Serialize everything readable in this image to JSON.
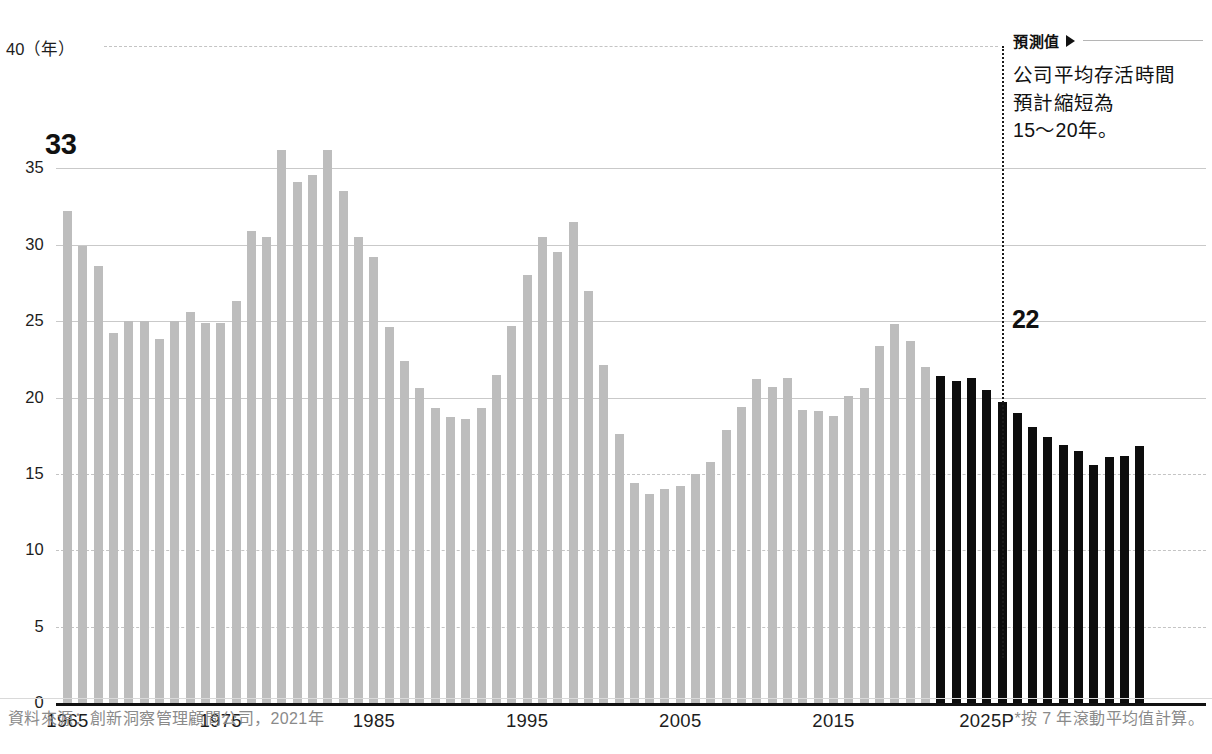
{
  "chart_data": {
    "type": "bar",
    "title": "",
    "xlabel": "",
    "ylabel": "年",
    "unit_label": "（年）",
    "ylim": [
      0,
      40
    ],
    "y_ticks": [
      0,
      5,
      10,
      15,
      20,
      25,
      30,
      35,
      40
    ],
    "x_tick_labels": [
      "1965",
      "1975",
      "1985",
      "1995",
      "2005",
      "2015",
      "2025P"
    ],
    "x_tick_years": [
      1965,
      1975,
      1985,
      1995,
      2005,
      2015,
      2025
    ],
    "grid": true,
    "legend": "none",
    "forecast_start_year": 2022,
    "colors": {
      "actual_bar": "#bdbdbd",
      "forecast_bar": "#0d0d0d",
      "grid": "#c9c9c9",
      "axis": "#111111",
      "text": "#1a1a1a",
      "muted_text": "#8a8a8a"
    },
    "series": [
      {
        "name": "公司平均存活時間",
        "years": [
          1965,
          1966,
          1967,
          1968,
          1969,
          1970,
          1971,
          1972,
          1973,
          1974,
          1975,
          1976,
          1977,
          1978,
          1979,
          1980,
          1981,
          1982,
          1983,
          1984,
          1985,
          1986,
          1987,
          1988,
          1989,
          1990,
          1991,
          1992,
          1993,
          1994,
          1995,
          1996,
          1997,
          1998,
          1999,
          2000,
          2001,
          2002,
          2003,
          2004,
          2005,
          2006,
          2007,
          2008,
          2009,
          2010,
          2011,
          2012,
          2013,
          2014,
          2015,
          2016,
          2017,
          2018,
          2019,
          2020,
          2021,
          2022,
          2023,
          2024,
          2025,
          2026,
          2027,
          2028,
          2029
        ],
        "values": [
          32.2,
          29.9,
          28.6,
          24.2,
          25.0,
          25.0,
          23.8,
          25.0,
          25.6,
          24.9,
          24.9,
          26.3,
          30.9,
          30.5,
          36.2,
          34.1,
          34.6,
          36.2,
          33.5,
          30.5,
          29.2,
          24.6,
          22.4,
          20.6,
          19.3,
          18.7,
          18.6,
          19.3,
          21.5,
          24.7,
          28.0,
          30.5,
          29.5,
          31.5,
          27.0,
          22.1,
          17.6,
          14.4,
          13.7,
          14.0,
          14.2,
          15.0,
          15.8,
          17.9,
          19.4,
          21.2,
          20.7,
          21.3,
          19.2,
          19.1,
          18.8,
          20.1,
          20.6,
          23.4,
          24.8,
          23.7,
          22.0,
          21.4,
          21.1,
          21.3,
          20.5,
          19.7,
          19.0,
          18.1,
          17.4,
          16.9,
          16.5,
          15.6,
          16.1,
          16.2,
          16.8
        ],
        "forecast_from_index": 57
      }
    ],
    "annotations": [
      {
        "name": "first-value",
        "text": "33",
        "year": 1965
      },
      {
        "name": "forecast-value",
        "text": "22",
        "year": 2022
      }
    ]
  },
  "callouts": {
    "start_value": "33",
    "forecast_value": "22"
  },
  "forecast_panel": {
    "heading": "預測值",
    "arrow_icon": "triangle-right-icon",
    "lines": [
      "公司平均存活時間",
      "預計縮短為",
      "15～20年。"
    ]
  },
  "axes": {
    "y_unit": "40（年）",
    "y_ticks": [
      "35",
      "30",
      "25",
      "20",
      "15",
      "10",
      "5",
      "0"
    ],
    "y_tick_values": [
      35,
      30,
      25,
      20,
      15,
      10,
      5,
      0
    ],
    "x_labels": [
      "1965",
      "1975",
      "1985",
      "1995",
      "2005",
      "2015",
      "2025P"
    ]
  },
  "footer": {
    "source": "資料來源：創新洞察管理顧問公司，2021年",
    "note": "*按 7 年滾動平均值計算。"
  }
}
